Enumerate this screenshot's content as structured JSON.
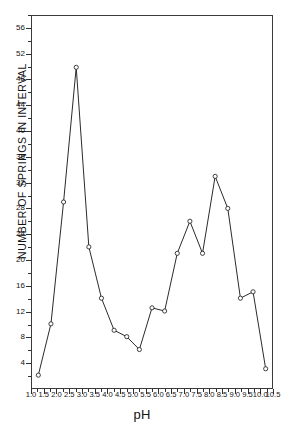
{
  "chart_data": {
    "type": "line",
    "title": "",
    "xlabel": "pH",
    "ylabel": "NUMBER OF SPRINGS IN INTERVAL",
    "xlim": [
      1.0,
      10.5
    ],
    "ylim": [
      0,
      58
    ],
    "grid": false,
    "legend": "none",
    "marker": "open-circle",
    "line_color": "#2b2b2b",
    "x_tick_labels": [
      "1.0",
      "1.5",
      "2.0",
      "2.5",
      "3.0",
      "3.5",
      "4.0",
      "4.5",
      "5.0",
      "5.5",
      "6.0",
      "6.5",
      "7.0",
      "7.5",
      "8.0",
      "8.5",
      "9.0",
      "9.5",
      "10.0",
      "10.5"
    ],
    "x_tick_values": [
      1.0,
      1.5,
      2.0,
      2.5,
      3.0,
      3.5,
      4.0,
      4.5,
      5.0,
      5.5,
      6.0,
      6.5,
      7.0,
      7.5,
      8.0,
      8.5,
      9.0,
      9.5,
      10.0,
      10.5
    ],
    "y_tick_labels": [
      "4",
      "8",
      "12",
      "16",
      "20",
      "24",
      "28",
      "32",
      "36",
      "40",
      "44",
      "48",
      "52",
      "56"
    ],
    "y_tick_values": [
      4,
      8,
      12,
      16,
      20,
      24,
      28,
      32,
      36,
      40,
      44,
      48,
      52,
      56
    ],
    "x": [
      1.25,
      1.75,
      2.25,
      2.75,
      3.25,
      3.75,
      4.25,
      4.75,
      5.25,
      5.75,
      6.25,
      6.75,
      7.25,
      7.75,
      8.25,
      8.75,
      9.25,
      9.75,
      10.25
    ],
    "values": [
      2,
      10,
      29,
      50,
      22,
      14,
      9,
      8,
      6,
      12.5,
      12,
      21,
      26,
      21,
      33,
      28,
      14,
      15,
      3
    ],
    "series": [
      {
        "name": "Number of springs in interval",
        "values": [
          2,
          10,
          29,
          50,
          22,
          14,
          9,
          8,
          6,
          12.5,
          12,
          21,
          26,
          21,
          33,
          28,
          14,
          15,
          3
        ]
      }
    ]
  },
  "axes": {
    "x_title": "pH",
    "y_title": "NUMBER OF SPRINGS IN INTERVAL"
  }
}
